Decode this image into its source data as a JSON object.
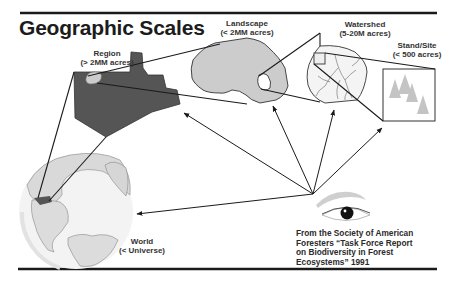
{
  "title": "Geographic Scales",
  "scales": [
    {
      "name": "Region",
      "range": "(> 2MM acres)"
    },
    {
      "name": "Landscape",
      "range": "(< 2MM acres)"
    },
    {
      "name": "Watershed",
      "range": "(5-20M acres)"
    },
    {
      "name": "Stand/Site",
      "range": "(< 500 acres)"
    },
    {
      "name": "World",
      "range": "(< Universe)"
    }
  ],
  "citation": {
    "lines": [
      "From the Society of American",
      "Foresters “Task Force Report",
      "on Biodiversity in Forest",
      "Ecosystems” 1991"
    ]
  },
  "icons": {
    "observer": "eye-icon",
    "world": "globe-icon",
    "stand": "tree-icon"
  },
  "colors": {
    "region_fill": "#555555",
    "landscape_fill": "#cccccc",
    "globe_ocean": "#f2f2f2",
    "globe_land": "#d9d9d9",
    "line": "#1a1a1a",
    "tree": "#bdbdbd"
  }
}
